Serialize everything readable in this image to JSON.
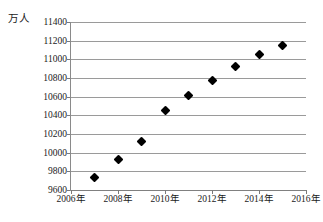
{
  "chart": {
    "unit_label": "万人",
    "marker_color": "#000000",
    "grid_color": "#9a9a9a",
    "axis_color": "#808080"
  },
  "chart_data": {
    "type": "scatter",
    "title": "",
    "subtitle": "",
    "xlabel": "",
    "ylabel": "万人",
    "xlim": [
      2006,
      2016
    ],
    "ylim": [
      9600,
      11400
    ],
    "grid": true,
    "legend": "none",
    "x_tick_labels": [
      "2006年",
      "2008年",
      "2010年",
      "2012年",
      "2014年",
      "2016年"
    ],
    "x_ticks": [
      2006,
      2008,
      2010,
      2012,
      2014,
      2016
    ],
    "y_tick_labels": [
      "9600",
      "9800",
      "10000",
      "10200",
      "10400",
      "10600",
      "10800",
      "11000",
      "11200",
      "11400"
    ],
    "y_ticks": [
      9600,
      9800,
      10000,
      10200,
      10400,
      10600,
      10800,
      11000,
      11200,
      11400
    ],
    "x": [
      2007,
      2008,
      2009,
      2010,
      2011,
      2012,
      2013,
      2014,
      2015
    ],
    "values": [
      9735,
      9930,
      10120,
      10450,
      10610,
      10775,
      10920,
      11050,
      11145
    ],
    "points": [
      {
        "x": 2007,
        "y": 9735
      },
      {
        "x": 2008,
        "y": 9930
      },
      {
        "x": 2009,
        "y": 10120
      },
      {
        "x": 2010,
        "y": 10450
      },
      {
        "x": 2011,
        "y": 10610
      },
      {
        "x": 2012,
        "y": 10775
      },
      {
        "x": 2013,
        "y": 10920
      },
      {
        "x": 2014,
        "y": 11050
      },
      {
        "x": 2015,
        "y": 11145
      }
    ]
  }
}
